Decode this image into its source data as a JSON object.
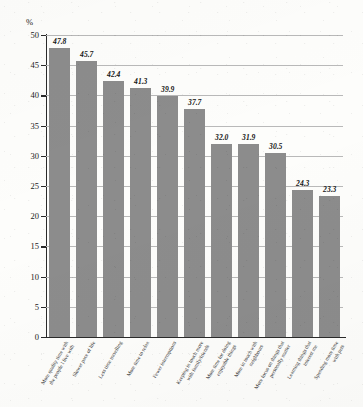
{
  "chart_data": {
    "type": "bar",
    "title": "",
    "xlabel": "",
    "ylabel": "%",
    "ylim": [
      0,
      50
    ],
    "ytick_step": 5,
    "yticks": [
      "0",
      "5",
      "10",
      "15",
      "20",
      "25",
      "30",
      "35",
      "40",
      "45",
      "50"
    ],
    "grid": true,
    "legend": "none",
    "bar_color": "#8c8c8c",
    "categories": [
      "More quality time with the people I live with",
      "Slower pace of life",
      "Less time travelling",
      "More time to relax",
      "Fewer interruptions",
      "Keeping in touch more with family/friends",
      "More time for doing enjoyable things",
      "More in touch with neighbours",
      "More focus on things that personally matter",
      "Learning things that interest me",
      "Spending more time with pets"
    ],
    "category_lines": [
      [
        "More quality time with",
        "the people I live with"
      ],
      [
        "Slower pace of life"
      ],
      [
        "Less time travelling"
      ],
      [
        "More time to relax"
      ],
      [
        "Fewer interruptions"
      ],
      [
        "Keeping in touch more",
        "with family/friends"
      ],
      [
        "More time for doing",
        "enjoyable things"
      ],
      [
        "More in touch with",
        "neighbours"
      ],
      [
        "More focus on things that",
        "personally matter"
      ],
      [
        "Learning things that",
        "interest me"
      ],
      [
        "Spending more time",
        "with pets"
      ]
    ],
    "values": [
      47.8,
      45.7,
      42.4,
      41.3,
      39.9,
      37.7,
      32.0,
      31.9,
      30.5,
      24.3,
      23.3
    ],
    "value_labels": [
      "47.8",
      "45.7",
      "42.4",
      "41.3",
      "39.9",
      "37.7",
      "32.0",
      "31.9",
      "30.5",
      "24.3",
      "23.3"
    ]
  }
}
